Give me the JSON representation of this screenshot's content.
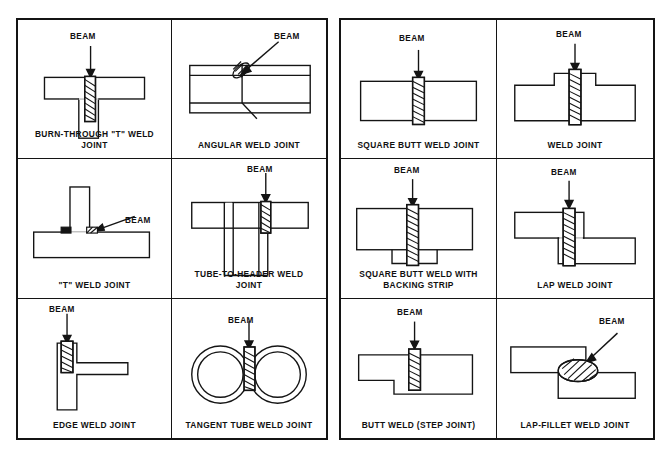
{
  "page": {
    "background_color": "#ffffff",
    "line_color": "#141414",
    "beam_label": "BEAM"
  },
  "tables": [
    {
      "name": "left-table",
      "cells": [
        {
          "id": "burn-through-t-weld-joint",
          "caption": "BURN-THROUGH \"T\" WELD\nJOINT",
          "beam_label": "BEAM",
          "beam_arrow": "vertical",
          "weld_type": "hatched-column"
        },
        {
          "id": "angular-weld-joint",
          "caption": "ANGULAR WELD JOINT",
          "beam_label": "BEAM",
          "beam_arrow": "diagonal",
          "weld_type": "angled-nugget"
        },
        {
          "id": "t-weld-joint",
          "caption": "\"T\" WELD JOINT",
          "beam_label": "BEAM",
          "beam_arrow": "diagonal",
          "weld_type": "fillet-beads"
        },
        {
          "id": "tube-to-header-weld-joint",
          "caption": "TUBE-TO-HEADER WELD\nJOINT",
          "beam_label": "BEAM",
          "beam_arrow": "vertical",
          "weld_type": "hatched-column"
        },
        {
          "id": "edge-weld-joint",
          "caption": "EDGE WELD JOINT",
          "beam_label": "BEAM",
          "beam_arrow": "vertical",
          "weld_type": "hatched-column"
        },
        {
          "id": "tangent-tube-weld-joint",
          "caption": "TANGENT TUBE WELD JOINT",
          "beam_label": "BEAM",
          "beam_arrow": "vertical",
          "weld_type": "hatched-column"
        }
      ]
    },
    {
      "name": "right-table",
      "cells": [
        {
          "id": "square-butt-weld-joint",
          "caption": "SQUARE BUTT WELD JOINT",
          "beam_label": "BEAM",
          "beam_arrow": "vertical",
          "weld_type": "hatched-column"
        },
        {
          "id": "weld-joint",
          "caption": "WELD JOINT",
          "beam_label": "BEAM",
          "beam_arrow": "vertical",
          "weld_type": "hatched-column"
        },
        {
          "id": "square-butt-weld-with-backing-strip",
          "caption": "SQUARE BUTT WELD WITH\nBACKING STRIP",
          "beam_label": "BEAM",
          "beam_arrow": "vertical",
          "weld_type": "hatched-column"
        },
        {
          "id": "lap-weld-joint",
          "caption": "LAP WELD JOINT",
          "beam_label": "BEAM",
          "beam_arrow": "vertical",
          "weld_type": "hatched-column"
        },
        {
          "id": "butt-weld-step-joint",
          "caption": "BUTT WELD (STEP JOINT)",
          "beam_label": "BEAM",
          "beam_arrow": "vertical",
          "weld_type": "hatched-column"
        },
        {
          "id": "lap-fillet-weld-joint",
          "caption": "LAP-FILLET WELD JOINT",
          "beam_label": "BEAM",
          "beam_arrow": "diagonal",
          "weld_type": "hatched-blob"
        }
      ]
    }
  ]
}
